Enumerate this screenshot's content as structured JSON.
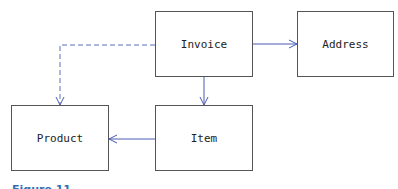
{
  "diagram": {
    "nodes": [
      {
        "id": "invoice",
        "label": "Invoice"
      },
      {
        "id": "address",
        "label": "Address"
      },
      {
        "id": "product",
        "label": "Product"
      },
      {
        "id": "item",
        "label": "Item"
      }
    ],
    "edges": [
      {
        "from": "invoice",
        "to": "address",
        "style": "solid"
      },
      {
        "from": "invoice",
        "to": "item",
        "style": "solid"
      },
      {
        "from": "item",
        "to": "product",
        "style": "solid"
      },
      {
        "from": "invoice",
        "to": "product",
        "style": "dashed"
      }
    ],
    "colors": {
      "edge": "#4a5cb0",
      "dashed_edge": "#5a6fc0",
      "box_border": "#555555",
      "caption": "#2f6fb6"
    }
  },
  "caption": "Figure 11"
}
